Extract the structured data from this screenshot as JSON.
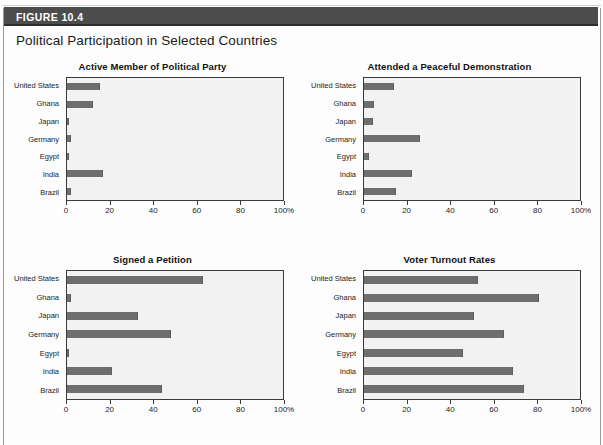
{
  "header": {
    "figure_label": "FIGURE 10.4",
    "band_color": "#4c4c4c"
  },
  "figure_title": "Political Participation in Selected Countries",
  "style": {
    "bar_color": "#6e6e6e",
    "plot_background": "#f2f2f2",
    "axis_color": "#3b3b3b"
  },
  "axis": {
    "ticks": [
      0,
      20,
      40,
      60,
      80,
      100
    ],
    "tick_labels": [
      "0",
      "20",
      "40",
      "60",
      "80",
      "100%"
    ],
    "min": 0,
    "max": 100
  },
  "countries": [
    "United States",
    "Ghana",
    "Japan",
    "Germany",
    "Egypt",
    "India",
    "Brazil"
  ],
  "chart_data": [
    {
      "type": "bar",
      "orientation": "horizontal",
      "title": "Active Member of Political Party",
      "xlabel": "",
      "ylabel": "",
      "xlim": [
        0,
        100
      ],
      "grid": false,
      "legend": "none",
      "categories": [
        "United States",
        "Ghana",
        "Japan",
        "Germany",
        "Egypt",
        "India",
        "Brazil"
      ],
      "values": [
        15.5,
        12,
        1,
        2,
        0.7,
        16.5,
        2
      ],
      "tick_labels": [
        "0",
        "20",
        "40",
        "60",
        "80",
        "100%"
      ]
    },
    {
      "type": "bar",
      "orientation": "horizontal",
      "title": "Attended a Peaceful Demonstration",
      "xlabel": "",
      "ylabel": "",
      "xlim": [
        0,
        100
      ],
      "grid": false,
      "legend": "none",
      "categories": [
        "United States",
        "Ghana",
        "Japan",
        "Germany",
        "Egypt",
        "India",
        "Brazil"
      ],
      "values": [
        14,
        4.5,
        4,
        26,
        2.5,
        22,
        15
      ],
      "tick_labels": [
        "0",
        "20",
        "40",
        "60",
        "80",
        "100%"
      ]
    },
    {
      "type": "bar",
      "orientation": "horizontal",
      "title": "Signed a Petition",
      "xlabel": "",
      "ylabel": "",
      "xlim": [
        0,
        100
      ],
      "grid": false,
      "legend": "none",
      "categories": [
        "United States",
        "Ghana",
        "Japan",
        "Germany",
        "Egypt",
        "India",
        "Brazil"
      ],
      "values": [
        63,
        2,
        33,
        48,
        1,
        21,
        44
      ],
      "tick_labels": [
        "0",
        "20",
        "40",
        "60",
        "80",
        "100%"
      ]
    },
    {
      "type": "bar",
      "orientation": "horizontal",
      "title": "Voter Turnout Rates",
      "xlabel": "",
      "ylabel": "",
      "xlim": [
        0,
        100
      ],
      "grid": false,
      "legend": "none",
      "categories": [
        "United States",
        "Ghana",
        "Japan",
        "Germany",
        "Egypt",
        "India",
        "Brazil"
      ],
      "values": [
        53,
        81,
        51,
        65,
        46,
        69,
        74
      ],
      "tick_labels": [
        "0",
        "20",
        "40",
        "60",
        "80",
        "100%"
      ]
    }
  ]
}
